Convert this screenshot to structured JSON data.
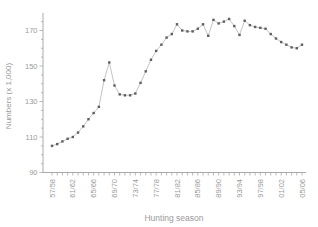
{
  "chart_data": {
    "type": "line",
    "title": "",
    "xlabel": "Hunting season",
    "ylabel": "Numbers (x 1,000)",
    "seasons": [
      "57/58",
      "58/59",
      "59/60",
      "60/61",
      "61/62",
      "62/63",
      "63/64",
      "64/65",
      "65/66",
      "66/67",
      "67/68",
      "68/69",
      "69/70",
      "70/71",
      "71/72",
      "72/73",
      "73/74",
      "74/75",
      "75/76",
      "76/77",
      "77/78",
      "78/79",
      "79/80",
      "80/81",
      "81/82",
      "82/83",
      "83/84",
      "84/85",
      "85/86",
      "86/87",
      "87/88",
      "88/89",
      "89/90",
      "90/91",
      "91/92",
      "92/93",
      "93/94",
      "94/95",
      "95/96",
      "96/97",
      "97/98",
      "98/99",
      "99/00",
      "00/01",
      "01/02",
      "02/03",
      "03/04",
      "04/05",
      "05/06"
    ],
    "values": [
      105,
      106,
      107.5,
      109,
      110,
      112.5,
      116,
      120,
      123.5,
      127,
      142,
      152,
      139,
      134,
      133.5,
      133.5,
      134.5,
      140.5,
      147,
      153.5,
      158.5,
      162,
      166,
      168,
      173.5,
      170,
      169.5,
      169.5,
      171,
      173.5,
      167,
      176,
      174,
      175,
      176.5,
      172.5,
      167.5,
      175.5,
      173,
      172,
      171.5,
      171,
      168,
      165.5,
      163.5,
      162,
      160.5,
      160,
      162
    ],
    "x_tick_labels": [
      "57/58",
      "61/62",
      "65/66",
      "69/70",
      "73/74",
      "77/78",
      "81/82",
      "85/86",
      "89/90",
      "93/94",
      "97/98",
      "01/02",
      "05/06"
    ],
    "x_tick_every": 4,
    "y_ticks_major": [
      90,
      110,
      130,
      150,
      170
    ],
    "y_minor_step": 5,
    "ylim": [
      90,
      180
    ],
    "legend": "none",
    "grid": "off",
    "colors": {
      "line": "#b4b4b4",
      "marker": "#5f5f5f",
      "axis": "#aaaaaa",
      "text": "#9a9a9a"
    }
  }
}
